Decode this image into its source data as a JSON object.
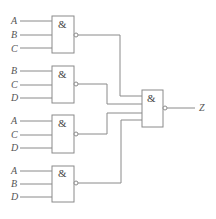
{
  "diagram": {
    "type": "logic-circuit",
    "gate_symbol": "&",
    "input_gates": [
      {
        "id": "g1",
        "inputs": [
          "A",
          "B",
          "C"
        ]
      },
      {
        "id": "g2",
        "inputs": [
          "B",
          "C",
          "D"
        ]
      },
      {
        "id": "g3",
        "inputs": [
          "A",
          "C",
          "D"
        ]
      },
      {
        "id": "g4",
        "inputs": [
          "A",
          "B",
          "D"
        ]
      }
    ],
    "output_gate": {
      "id": "g5",
      "inputs": [
        "g1",
        "g2",
        "g3",
        "g4"
      ]
    },
    "output_label": "Z",
    "colors": {
      "line": "#8a8a8a",
      "text": "#555555"
    }
  }
}
